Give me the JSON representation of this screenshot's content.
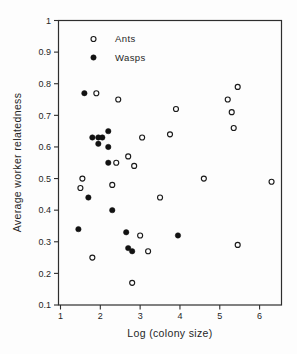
{
  "figure": {
    "background": "#fdfdfd",
    "ink_color": "#2e2e2e",
    "marker_color": "#1a1a1a"
  },
  "chart_data": {
    "type": "scatter",
    "title": "",
    "xlabel": "Log (colony size)",
    "ylabel": "Average worker relatedness",
    "xlim": [
      0.95,
      6.55
    ],
    "ylim": [
      0.1,
      1.0
    ],
    "xticks": [
      1,
      2,
      3,
      4,
      5,
      6
    ],
    "xtick_labels": [
      "1",
      "2",
      "3",
      "4",
      "5",
      "6"
    ],
    "yticks": [
      1.0,
      0.9,
      0.8,
      0.7,
      0.6,
      0.5,
      0.4,
      0.3,
      0.2,
      0.1
    ],
    "ytick_labels": [
      "1",
      "0.9",
      "0.8",
      "0.7",
      "0.6",
      "0.5",
      "0.4",
      "0.3",
      "0.2",
      "0.1"
    ],
    "grid": false,
    "legend": {
      "position": "upper-left-inside",
      "entries": [
        {
          "label": "Ants",
          "marker": "open-circle"
        },
        {
          "label": "Wasps",
          "marker": "filled-circle"
        }
      ]
    },
    "series": [
      {
        "name": "Ants",
        "marker": "open-circle",
        "points": [
          [
            1.9,
            0.77
          ],
          [
            2.45,
            0.75
          ],
          [
            3.9,
            0.72
          ],
          [
            5.2,
            0.75
          ],
          [
            5.45,
            0.79
          ],
          [
            5.3,
            0.71
          ],
          [
            5.35,
            0.66
          ],
          [
            3.75,
            0.64
          ],
          [
            3.05,
            0.63
          ],
          [
            2.7,
            0.57
          ],
          [
            2.4,
            0.55
          ],
          [
            2.85,
            0.54
          ],
          [
            1.55,
            0.5
          ],
          [
            4.6,
            0.5
          ],
          [
            6.3,
            0.49
          ],
          [
            2.3,
            0.48
          ],
          [
            1.5,
            0.47
          ],
          [
            3.5,
            0.44
          ],
          [
            3.0,
            0.32
          ],
          [
            5.45,
            0.29
          ],
          [
            3.2,
            0.27
          ],
          [
            1.8,
            0.25
          ],
          [
            2.8,
            0.17
          ]
        ]
      },
      {
        "name": "Wasps",
        "marker": "filled-circle",
        "points": [
          [
            1.6,
            0.77
          ],
          [
            2.2,
            0.65
          ],
          [
            1.8,
            0.63
          ],
          [
            1.95,
            0.63
          ],
          [
            2.05,
            0.63
          ],
          [
            1.95,
            0.61
          ],
          [
            2.2,
            0.6
          ],
          [
            2.2,
            0.55
          ],
          [
            1.7,
            0.44
          ],
          [
            2.3,
            0.4
          ],
          [
            1.45,
            0.34
          ],
          [
            2.65,
            0.33
          ],
          [
            3.95,
            0.32
          ],
          [
            2.7,
            0.28
          ],
          [
            2.8,
            0.27
          ]
        ]
      }
    ]
  }
}
